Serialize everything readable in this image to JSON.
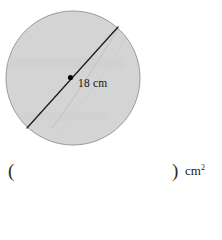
{
  "figure": {
    "shape_name": "circle",
    "fill_color": "#d4d4d4",
    "stroke_color": "#9a9a9a",
    "diameter_line_color": "#1c1c1c",
    "center_dot_color": "#000000",
    "dimension_label": "18 cm",
    "dimension_value": "18",
    "dimension_unit": "cm",
    "watermark_color": "#c8c8c8"
  },
  "answer": {
    "open_paren": "(",
    "close_paren": ")",
    "blank_value": "",
    "blank_placeholder": "",
    "unit_text": "cm",
    "unit_exponent": "2"
  }
}
